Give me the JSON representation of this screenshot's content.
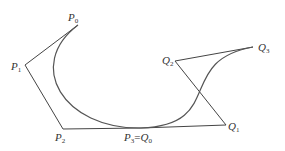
{
  "diagram": {
    "type": "bezier-curves-join",
    "colors": {
      "polygon": "#444444",
      "curve": "#555555",
      "label": "#333333"
    },
    "curves": [
      {
        "name": "P-curve",
        "control_points": [
          {
            "id": "P0",
            "label": "P",
            "sub": "0",
            "x": 78,
            "y": 25
          },
          {
            "id": "P1",
            "label": "P",
            "sub": "1",
            "x": 25,
            "y": 65
          },
          {
            "id": "P2",
            "label": "P",
            "sub": "2",
            "x": 63,
            "y": 129
          },
          {
            "id": "P3",
            "label": "P",
            "sub": "3",
            "x": 141,
            "y": 128
          }
        ]
      },
      {
        "name": "Q-curve",
        "control_points": [
          {
            "id": "Q0",
            "label": "Q",
            "sub": "0",
            "x": 141,
            "y": 128
          },
          {
            "id": "Q1",
            "label": "Q",
            "sub": "1",
            "x": 226,
            "y": 125
          },
          {
            "id": "Q2",
            "label": "Q",
            "sub": "2",
            "x": 175,
            "y": 61
          },
          {
            "id": "Q3",
            "label": "Q",
            "sub": "3",
            "x": 253,
            "y": 47
          }
        ]
      }
    ],
    "labels": {
      "p0": {
        "main": "P",
        "sub": "0"
      },
      "p1": {
        "main": "P",
        "sub": "1"
      },
      "p2": {
        "main": "P",
        "sub": "2"
      },
      "p3q0": {
        "main": "P",
        "sub": "3",
        "eq": "=",
        "main2": "Q",
        "sub2": "0"
      },
      "q1": {
        "main": "Q",
        "sub": "1"
      },
      "q2": {
        "main": "Q",
        "sub": "2"
      },
      "q3": {
        "main": "Q",
        "sub": "3"
      }
    }
  }
}
